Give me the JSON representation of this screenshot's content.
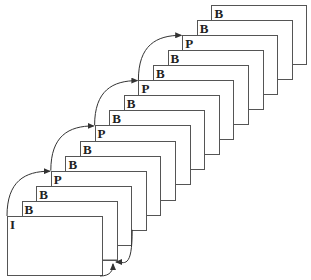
{
  "diagram": {
    "title": "",
    "frame_geometry": {
      "first_left": 7,
      "first_top": 216,
      "width": 96,
      "height": 60,
      "dx": 14.6,
      "dy": -15.1,
      "border_color": "#555555"
    },
    "frames": [
      {
        "label": "I"
      },
      {
        "label": "B"
      },
      {
        "label": "B"
      },
      {
        "label": "P"
      },
      {
        "label": "B"
      },
      {
        "label": "B"
      },
      {
        "label": "P"
      },
      {
        "label": "B"
      },
      {
        "label": "B"
      },
      {
        "label": "P"
      },
      {
        "label": "B"
      },
      {
        "label": "B"
      },
      {
        "label": "P"
      },
      {
        "label": "B"
      },
      {
        "label": "B"
      }
    ],
    "forward_arrows": [
      {
        "from": 0,
        "to": 3
      },
      {
        "from": 3,
        "to": 6
      },
      {
        "from": 6,
        "to": 9
      },
      {
        "from": 9,
        "to": 12
      }
    ],
    "backward_arrows": [
      {
        "from": 1,
        "to": 0
      },
      {
        "from": 2,
        "to": 0
      }
    ]
  }
}
